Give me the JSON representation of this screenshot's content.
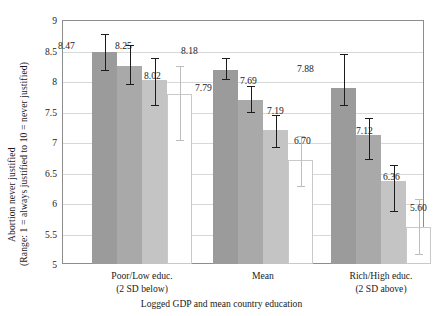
{
  "chart_data": {
    "type": "bar",
    "title": "",
    "xlabel": "Logged GDP and mean country education",
    "ylabel_line1": "Abortion never justified",
    "ylabel_line2": "(Range: 1 = always justified to 10 = never justified)",
    "ylim": [
      5,
      9
    ],
    "yticks": [
      "5",
      "5.5",
      "6",
      "6.5",
      "7",
      "7.5",
      "8",
      "8.5",
      "9"
    ],
    "ytick_values": [
      5,
      5.5,
      6,
      6.5,
      7,
      7.5,
      8,
      8.5,
      9
    ],
    "grid": true,
    "legend": "none",
    "categories": [
      "Poor/Low educ.",
      "Mean",
      "Rich/High educ."
    ],
    "category_sublabels": [
      "(2 SD below)",
      "",
      "(2 SD above)"
    ],
    "series": [
      {
        "name": "Series 1",
        "values": [
          8.47,
          8.18,
          7.88
        ],
        "color": "#9b9b9b"
      },
      {
        "name": "Series 2",
        "values": [
          8.25,
          7.69,
          7.12
        ],
        "color": "#a9a9a9"
      },
      {
        "name": "Series 3",
        "values": [
          8.02,
          7.19,
          6.36
        ],
        "color": "#c4c4c4"
      },
      {
        "name": "Series 4",
        "values": [
          7.79,
          6.7,
          5.6
        ],
        "color": "#ffffff"
      }
    ],
    "error_bars": [
      {
        "group": 0,
        "series": 0,
        "low": 8.17,
        "high": 8.77
      },
      {
        "group": 0,
        "series": 1,
        "low": 7.93,
        "high": 8.59
      },
      {
        "group": 0,
        "series": 2,
        "low": 7.59,
        "high": 8.38
      },
      {
        "group": 0,
        "series": 3,
        "low": 7.01,
        "high": 8.25
      },
      {
        "group": 1,
        "series": 0,
        "low": 8.02,
        "high": 8.38
      },
      {
        "group": 1,
        "series": 1,
        "low": 7.47,
        "high": 7.92
      },
      {
        "group": 1,
        "series": 2,
        "low": 6.9,
        "high": 7.44
      },
      {
        "group": 1,
        "series": 3,
        "low": 6.26,
        "high": 7.1
      },
      {
        "group": 2,
        "series": 0,
        "low": 7.59,
        "high": 8.44
      },
      {
        "group": 2,
        "series": 1,
        "low": 6.7,
        "high": 7.4
      },
      {
        "group": 2,
        "series": 2,
        "low": 5.86,
        "high": 6.62
      },
      {
        "group": 2,
        "series": 3,
        "low": 5.14,
        "high": 6.06
      }
    ],
    "data_labels": [
      {
        "text": "8.47",
        "group": 0,
        "series": 0
      },
      {
        "text": "8.25",
        "group": 0,
        "series": 1
      },
      {
        "text": "8.02",
        "group": 0,
        "series": 2
      },
      {
        "text": "7.79",
        "group": 0,
        "series": 3
      },
      {
        "text": "8.18",
        "group": 1,
        "series": 0
      },
      {
        "text": "7.69",
        "group": 1,
        "series": 1
      },
      {
        "text": "7.19",
        "group": 1,
        "series": 2
      },
      {
        "text": "6.70",
        "group": 1,
        "series": 3
      },
      {
        "text": "7.88",
        "group": 2,
        "series": 0
      },
      {
        "text": "7.12",
        "group": 2,
        "series": 1
      },
      {
        "text": "6.36",
        "group": 2,
        "series": 2
      },
      {
        "text": "5.60",
        "group": 2,
        "series": 3
      }
    ]
  }
}
